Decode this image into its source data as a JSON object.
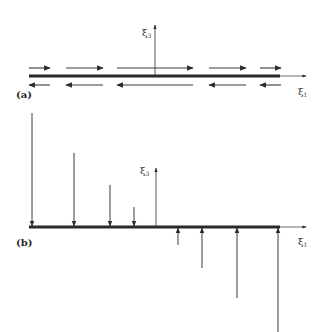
{
  "figure": {
    "panel_a": {
      "label": "(a)",
      "axis_x_label": "ξ",
      "axis_x_sub": "1",
      "axis_z_label": "ξ",
      "axis_z_sub": "3",
      "description": "Beam with antisymmetric shear tractions: upper-surface arrows point right, lower-surface arrows point left",
      "beam": {
        "x0": 29,
        "x1": 280,
        "y": 76
      },
      "x_axis_end": 306,
      "z_axis": {
        "x": 155,
        "y_top": 25
      },
      "top_arrows": [
        {
          "x0": 29,
          "x1": 50,
          "y": 68,
          "dir": "right"
        },
        {
          "x0": 66,
          "x1": 103,
          "y": 68,
          "dir": "right"
        },
        {
          "x0": 117,
          "x1": 193,
          "y": 68,
          "dir": "right"
        },
        {
          "x0": 209,
          "x1": 246,
          "y": 68,
          "dir": "right"
        },
        {
          "x0": 260,
          "x1": 281,
          "y": 68,
          "dir": "right"
        }
      ],
      "bottom_arrows": [
        {
          "x0": 29,
          "x1": 50,
          "y": 85,
          "dir": "left"
        },
        {
          "x0": 66,
          "x1": 103,
          "y": 85,
          "dir": "left"
        },
        {
          "x0": 117,
          "x1": 193,
          "y": 85,
          "dir": "left"
        },
        {
          "x0": 209,
          "x1": 246,
          "y": 85,
          "dir": "left"
        },
        {
          "x0": 260,
          "x1": 281,
          "y": 85,
          "dir": "left"
        }
      ]
    },
    "panel_b": {
      "label": "(b)",
      "axis_x_label": "ξ",
      "axis_x_sub": "1",
      "axis_z_label": "ξ",
      "axis_z_sub": "3",
      "description": "Beam with linearly varying normal load: downward arrows on left half, upward arrows on right half",
      "beam": {
        "x0": 29,
        "x1": 280,
        "y": 227
      },
      "x_axis_end": 306,
      "z_axis": {
        "x": 156,
        "y_top": 168
      },
      "down_arrows": [
        {
          "x": 32,
          "y_start": 113
        },
        {
          "x": 74,
          "y_start": 153
        },
        {
          "x": 110,
          "y_start": 185
        },
        {
          "x": 134,
          "y_start": 207
        }
      ],
      "up_arrows": [
        {
          "x": 178,
          "y_start": 245
        },
        {
          "x": 202,
          "y_start": 268
        },
        {
          "x": 237,
          "y_start": 298
        },
        {
          "x": 278,
          "y_start": 332
        }
      ]
    },
    "colors": {
      "ink": "#2b2b2b",
      "thin": "#555555",
      "background": "#ffffff"
    }
  }
}
